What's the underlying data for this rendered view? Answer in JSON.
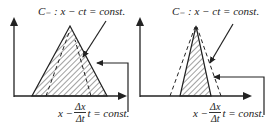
{
  "figure": {
    "left_panel": {
      "top_label": "C₋ : x − ct = const.",
      "bottom_label": {
        "prefix": "x −",
        "numerator": "Δx",
        "denominator": "Δt",
        "suffix": "t = const."
      },
      "description": "Wide hatched triangle containing dashed characteristic lines"
    },
    "right_panel": {
      "top_label": "C₋ : x − ct = const.",
      "bottom_label": {
        "prefix": "x −",
        "numerator": "Δx",
        "denominator": "Δt",
        "suffix": "t = const."
      },
      "description": "Narrow hatched triangle inside dashed characteristic lines"
    },
    "colors": {
      "line": "#222222",
      "hatch": "#444444",
      "background": "#ffffff"
    }
  }
}
